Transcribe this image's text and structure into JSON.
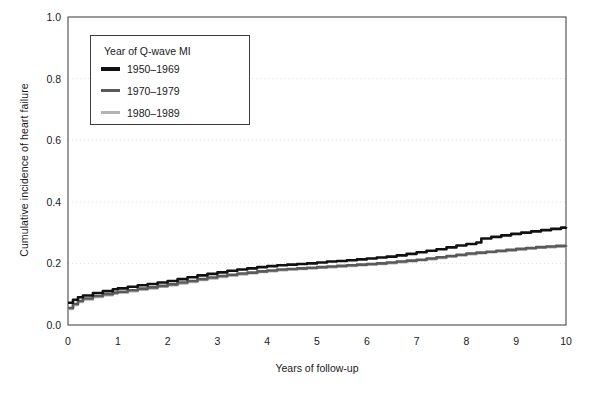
{
  "chart_data": {
    "type": "line",
    "title": "",
    "xlabel": "Years of follow-up",
    "ylabel": "Cumulative incidence of heart failure",
    "xlim": [
      0,
      10
    ],
    "ylim": [
      0.0,
      1.0
    ],
    "xticks": [
      "0",
      "1",
      "2",
      "3",
      "4",
      "5",
      "6",
      "7",
      "8",
      "9",
      "10"
    ],
    "yticks": [
      "0.0",
      "0.2",
      "0.4",
      "0.6",
      "0.8",
      "1.0"
    ],
    "grid": "horizontal-dotted-faint",
    "legend_position": "upper-left-inside",
    "legend_title": "Year of Q-wave MI",
    "series": [
      {
        "name": "1950–1969",
        "color": "#111111",
        "x": [
          0.0,
          0.1,
          0.2,
          0.3,
          0.5,
          0.7,
          0.9,
          1.0,
          1.2,
          1.4,
          1.6,
          1.8,
          2.0,
          2.2,
          2.4,
          2.6,
          2.8,
          3.0,
          3.2,
          3.4,
          3.6,
          3.8,
          4.0,
          4.2,
          4.4,
          4.6,
          4.8,
          5.0,
          5.2,
          5.4,
          5.6,
          5.8,
          6.0,
          6.2,
          6.4,
          6.6,
          6.8,
          7.0,
          7.2,
          7.4,
          7.6,
          7.8,
          8.0,
          8.2,
          8.3,
          8.5,
          8.7,
          8.9,
          9.1,
          9.3,
          9.5,
          9.7,
          9.9,
          10.0
        ],
        "y": [
          0.072,
          0.082,
          0.09,
          0.096,
          0.104,
          0.11,
          0.116,
          0.119,
          0.124,
          0.129,
          0.133,
          0.138,
          0.143,
          0.149,
          0.155,
          0.161,
          0.166,
          0.171,
          0.176,
          0.18,
          0.184,
          0.188,
          0.191,
          0.194,
          0.196,
          0.198,
          0.2,
          0.203,
          0.206,
          0.208,
          0.21,
          0.213,
          0.216,
          0.219,
          0.222,
          0.226,
          0.231,
          0.236,
          0.241,
          0.246,
          0.252,
          0.258,
          0.263,
          0.268,
          0.281,
          0.286,
          0.291,
          0.296,
          0.3,
          0.304,
          0.308,
          0.312,
          0.316,
          0.318
        ]
      },
      {
        "name": "1970–1979",
        "color": "#5a5a5a",
        "x": [
          0.0,
          0.1,
          0.2,
          0.3,
          0.5,
          0.7,
          0.9,
          1.0,
          1.2,
          1.4,
          1.6,
          1.8,
          2.0,
          2.2,
          2.4,
          2.6,
          2.8,
          3.0,
          3.2,
          3.4,
          3.6,
          3.8,
          4.0,
          4.2,
          4.4,
          4.6,
          4.8,
          5.0,
          5.2,
          5.4,
          5.6,
          5.8,
          6.0,
          6.2,
          6.4,
          6.6,
          6.8,
          7.0,
          7.2,
          7.4,
          7.6,
          7.8,
          8.0,
          8.2,
          8.4,
          8.6,
          8.8,
          9.0,
          9.2,
          9.4,
          9.6,
          9.8,
          10.0
        ],
        "y": [
          0.055,
          0.068,
          0.078,
          0.086,
          0.094,
          0.1,
          0.105,
          0.108,
          0.113,
          0.118,
          0.122,
          0.127,
          0.132,
          0.138,
          0.143,
          0.149,
          0.154,
          0.159,
          0.163,
          0.167,
          0.17,
          0.174,
          0.177,
          0.18,
          0.182,
          0.184,
          0.186,
          0.188,
          0.19,
          0.192,
          0.194,
          0.196,
          0.198,
          0.2,
          0.203,
          0.206,
          0.209,
          0.212,
          0.216,
          0.22,
          0.224,
          0.228,
          0.232,
          0.235,
          0.238,
          0.241,
          0.244,
          0.247,
          0.25,
          0.253,
          0.255,
          0.257,
          0.259
        ]
      },
      {
        "name": "1980–1989",
        "color": "#b4b4b4",
        "x": [
          0.0,
          0.1,
          0.2,
          0.3,
          0.5,
          0.7,
          0.9,
          1.0,
          1.2,
          1.4,
          1.6,
          1.8,
          2.0,
          2.2,
          2.4,
          2.6,
          2.8,
          3.0,
          3.2,
          3.4,
          3.6,
          3.8,
          4.0,
          4.2,
          4.4,
          4.6,
          4.8,
          5.0,
          5.2,
          5.4,
          5.6,
          5.8,
          6.0,
          6.2,
          6.4,
          6.6,
          6.8,
          7.0,
          7.2,
          7.4,
          7.6,
          7.8,
          8.0,
          8.2,
          8.4,
          8.6,
          8.8,
          9.0,
          9.2,
          9.4,
          9.6,
          9.8,
          10.0
        ],
        "y": [
          0.052,
          0.065,
          0.075,
          0.083,
          0.091,
          0.097,
          0.102,
          0.105,
          0.11,
          0.115,
          0.119,
          0.124,
          0.129,
          0.135,
          0.14,
          0.146,
          0.151,
          0.156,
          0.16,
          0.164,
          0.168,
          0.172,
          0.175,
          0.178,
          0.18,
          0.182,
          0.184,
          0.186,
          0.188,
          0.19,
          0.192,
          0.194,
          0.196,
          0.198,
          0.201,
          0.204,
          0.207,
          0.21,
          0.214,
          0.218,
          0.222,
          0.226,
          0.23,
          0.233,
          0.236,
          0.239,
          0.242,
          0.245,
          0.248,
          0.251,
          0.253,
          0.255,
          0.257
        ]
      }
    ]
  }
}
